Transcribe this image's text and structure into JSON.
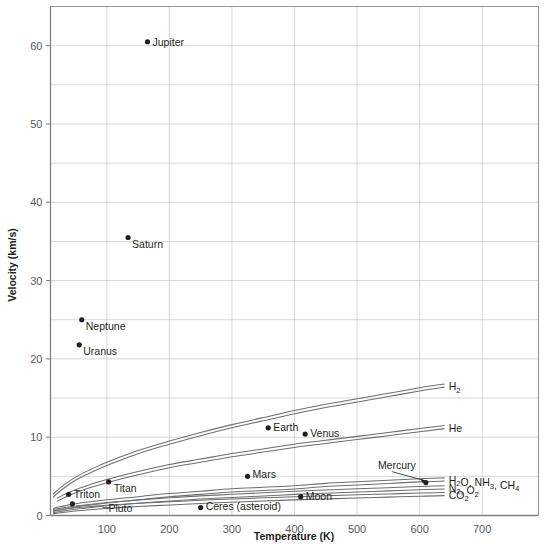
{
  "chart_data": {
    "type": "scatter",
    "title": "",
    "xlabel": "Temperature (K)",
    "ylabel": "Velocity (km/s)",
    "xlim": [
      10,
      790
    ],
    "ylim": [
      0,
      65
    ],
    "grid": true,
    "legend": "none",
    "x_ticks": [
      100,
      200,
      300,
      400,
      500,
      600,
      700
    ],
    "y_ticks": [
      0,
      10,
      20,
      30,
      40,
      50,
      60
    ],
    "y_gridlines": [
      0,
      5,
      10,
      15,
      20,
      25,
      30,
      35,
      40,
      45,
      50,
      55,
      60,
      65
    ],
    "points": [
      {
        "label": "Jupiter",
        "x": 165,
        "y": 60.5,
        "label_dx": 5,
        "label_dy": 4
      },
      {
        "label": "Saturn",
        "x": 134,
        "y": 35.5,
        "label_dx": 4,
        "label_dy": 10
      },
      {
        "label": "Neptune",
        "x": 60,
        "y": 25.0,
        "label_dx": 4,
        "label_dy": 10
      },
      {
        "label": "Uranus",
        "x": 56,
        "y": 21.8,
        "label_dx": 4,
        "label_dy": 10
      },
      {
        "label": "Earth",
        "x": 358,
        "y": 11.2,
        "label_dx": 5,
        "label_dy": 3
      },
      {
        "label": "Venus",
        "x": 417,
        "y": 10.4,
        "label_dx": 5,
        "label_dy": 3
      },
      {
        "label": "Mars",
        "x": 325,
        "y": 5.0,
        "label_dx": 5,
        "label_dy": 2
      },
      {
        "label": "Titan",
        "x": 103,
        "y": 4.3,
        "label_dx": 5,
        "label_dy": 10
      },
      {
        "label": "Triton",
        "x": 39,
        "y": 2.7,
        "label_dx": 5,
        "label_dy": 4
      },
      {
        "label": "Moon",
        "x": 410,
        "y": 2.4,
        "label_dx": 5,
        "label_dy": 3
      },
      {
        "label": "Pluto",
        "x": 45,
        "y": 1.5,
        "label_dx": 36,
        "label_dy": 8
      },
      {
        "label": "Ceres (asteroid)",
        "x": 250,
        "y": 1.0,
        "label_dx": 5,
        "label_dy": 2
      },
      {
        "label": "Mercury",
        "x": 610,
        "y": 4.2,
        "label_dx": -48,
        "label_dy": -14
      }
    ],
    "curves": [
      {
        "label": "H2",
        "label_html": "H<sub>2</sub>",
        "x": [
          14,
          25,
          50,
          75,
          100,
          150,
          200,
          250,
          300,
          350,
          400,
          450,
          500,
          550,
          600,
          640
        ],
        "y": [
          2.5,
          3.3,
          4.7,
          5.7,
          6.6,
          8.1,
          9.3,
          10.4,
          11.4,
          12.3,
          13.2,
          14.0,
          14.7,
          15.4,
          16.1,
          16.6
        ]
      },
      {
        "label": "He",
        "label_html": "He",
        "x": [
          20,
          30,
          50,
          75,
          100,
          150,
          200,
          250,
          300,
          350,
          400,
          450,
          500,
          550,
          600,
          640
        ],
        "y": [
          2.0,
          2.4,
          3.1,
          3.8,
          4.4,
          5.4,
          6.3,
          7.0,
          7.7,
          8.3,
          8.9,
          9.4,
          9.9,
          10.4,
          10.9,
          11.3
        ]
      },
      {
        "label": "H2O, NH3, CH4",
        "label_html": "H<sub>2</sub>O, NH<sub>3</sub>, CH<sub>4</sub>",
        "x": [
          14,
          25,
          50,
          100,
          150,
          200,
          250,
          300,
          350,
          400,
          450,
          500,
          550,
          600,
          640
        ],
        "y": [
          0.7,
          0.9,
          1.3,
          1.8,
          2.2,
          2.6,
          2.9,
          3.2,
          3.4,
          3.6,
          3.9,
          4.1,
          4.3,
          4.5,
          4.6
        ]
      },
      {
        "label": "N2, O2",
        "label_html": "N<sub>2</sub>, O<sub>2</sub>",
        "x": [
          14,
          25,
          50,
          100,
          150,
          200,
          250,
          300,
          350,
          400,
          450,
          500,
          550,
          600,
          640
        ],
        "y": [
          0.55,
          0.72,
          1.0,
          1.45,
          1.78,
          2.05,
          2.3,
          2.5,
          2.7,
          2.9,
          3.05,
          3.2,
          3.35,
          3.5,
          3.6
        ]
      },
      {
        "label": "CO2",
        "label_html": "CO<sub>2</sub>",
        "x": [
          14,
          25,
          50,
          100,
          150,
          200,
          250,
          300,
          350,
          400,
          450,
          500,
          550,
          600,
          640
        ],
        "y": [
          0.42,
          0.55,
          0.78,
          1.1,
          1.35,
          1.55,
          1.74,
          1.9,
          2.05,
          2.2,
          2.32,
          2.44,
          2.55,
          2.66,
          2.74
        ]
      }
    ],
    "colors": {
      "curve": "#6d6e71",
      "grid": "#bcbec0",
      "frame": "#939598",
      "text": "#231f20",
      "tick_text": "#58595b",
      "background": "#ffffff"
    }
  }
}
